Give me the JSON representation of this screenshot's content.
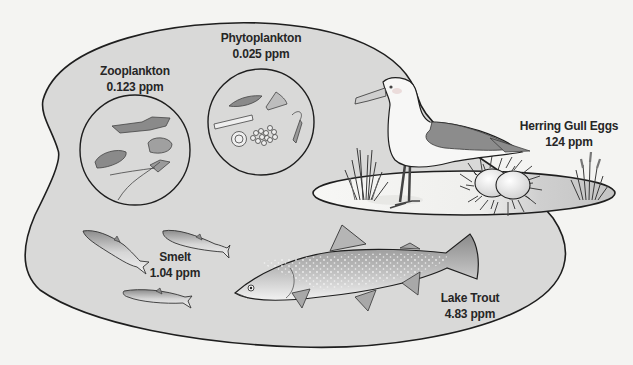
{
  "diagram": {
    "type": "food-web-biomagnification",
    "colors": {
      "background": "#f4f4f2",
      "lake_fill": "#d9d9d8",
      "outline": "#1e1e1e",
      "island_fill": "#f7f7f5",
      "island_shade": "#c4c4c4",
      "text": "#262626"
    },
    "organisms": [
      {
        "id": "zooplankton",
        "name": "Zooplankton",
        "concentration": "0.123 ppm"
      },
      {
        "id": "phytoplankton",
        "name": "Phytoplankton",
        "concentration": "0.025 ppm"
      },
      {
        "id": "herring-gull-eggs",
        "name": "Herring Gull Eggs",
        "concentration": "124 ppm"
      },
      {
        "id": "smelt",
        "name": "Smelt",
        "concentration": "1.04 ppm"
      },
      {
        "id": "lake-trout",
        "name": "Lake Trout",
        "concentration": "4.83 ppm"
      }
    ]
  }
}
